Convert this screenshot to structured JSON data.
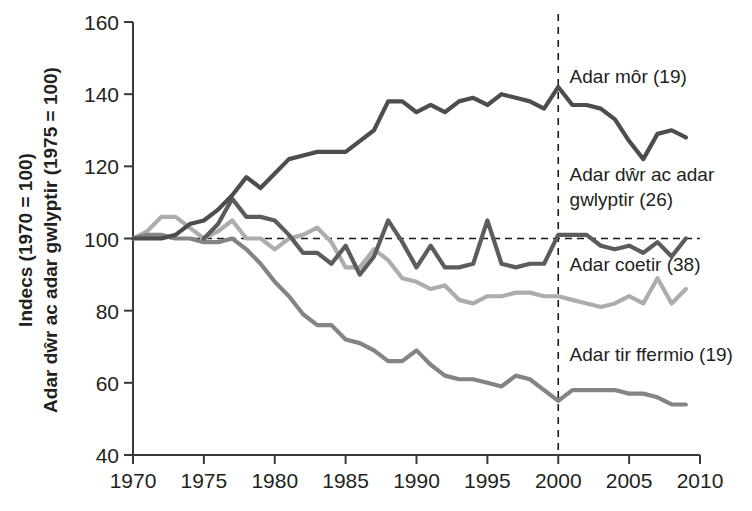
{
  "chart_data": {
    "type": "line",
    "title": "",
    "subtitle": "",
    "xlabel": "",
    "ylabel": "Indecs (1970 = 100)\nAdar dŵr ac adar gwlyptir (1975 = 100)",
    "ylabel_line1": "Indecs (1970 = 100)",
    "ylabel_line2": "Adar dŵr ac adar gwlyptir (1975 = 100)",
    "xlim": [
      1970,
      2010
    ],
    "ylim": [
      40,
      160
    ],
    "xticks": [
      1970,
      1975,
      1980,
      1985,
      1990,
      1995,
      2000,
      2005,
      2010
    ],
    "yticks": [
      40,
      60,
      80,
      100,
      120,
      140,
      160
    ],
    "grid": false,
    "legend_position": "inline-right",
    "annotations": [
      {
        "name": "reference-line-100",
        "type": "horizontal-dashed",
        "value": 100
      },
      {
        "name": "reference-line-2000",
        "type": "vertical-dashed",
        "value": 2000
      }
    ],
    "series": [
      {
        "name": "Adar môr (19)",
        "label": "Adar môr (19)",
        "color": "#4d4d4d",
        "label_x": 2000.8,
        "label_y": 143,
        "x": [
          1970,
          1971,
          1972,
          1973,
          1974,
          1975,
          1976,
          1977,
          1978,
          1979,
          1980,
          1981,
          1982,
          1983,
          1984,
          1985,
          1986,
          1987,
          1988,
          1989,
          1990,
          1991,
          1992,
          1993,
          1994,
          1995,
          1996,
          1997,
          1998,
          1999,
          2000,
          2001,
          2002,
          2003,
          2004,
          2005,
          2006,
          2007,
          2008,
          2009
        ],
        "y": [
          100,
          100,
          100,
          101,
          104,
          105,
          108,
          112,
          117,
          114,
          118,
          122,
          123,
          124,
          124,
          124,
          127,
          130,
          138,
          138,
          135,
          137,
          135,
          138,
          139,
          137,
          140,
          139,
          138,
          136,
          142,
          137,
          137,
          136,
          133,
          127,
          122,
          129,
          130,
          128
        ]
      },
      {
        "name": "Adar dŵr ac adar gwlyptir (26)",
        "label_line1": "Adar dŵr ac adar",
        "label_line2": "gwlyptir (26)",
        "color": "#5c5c5c",
        "label_x": 2000.8,
        "label_y": 116,
        "x": [
          1975,
          1976,
          1977,
          1978,
          1979,
          1980,
          1981,
          1982,
          1983,
          1984,
          1985,
          1986,
          1987,
          1988,
          1989,
          1990,
          1991,
          1992,
          1993,
          1994,
          1995,
          1996,
          1997,
          1998,
          1999,
          2000,
          2001,
          2002,
          2003,
          2004,
          2005,
          2006,
          2007,
          2008,
          2009
        ],
        "y": [
          100,
          104,
          111,
          106,
          106,
          105,
          101,
          96,
          96,
          93,
          98,
          90,
          95,
          105,
          99,
          92,
          98,
          92,
          92,
          93,
          105,
          93,
          92,
          93,
          93,
          101,
          101,
          101,
          98,
          97,
          98,
          96,
          99,
          95,
          100
        ]
      },
      {
        "name": "Adar coetir (38)",
        "label": "Adar coetir (38)",
        "color": "#adadad",
        "label_x": 2000.8,
        "label_y": 91,
        "x": [
          1970,
          1971,
          1972,
          1973,
          1974,
          1975,
          1976,
          1977,
          1978,
          1979,
          1980,
          1981,
          1982,
          1983,
          1984,
          1985,
          1986,
          1987,
          1988,
          1989,
          1990,
          1991,
          1992,
          1993,
          1994,
          1995,
          1996,
          1997,
          1998,
          1999,
          2000,
          2001,
          2002,
          2003,
          2004,
          2005,
          2006,
          2007,
          2008,
          2009
        ],
        "y": [
          100,
          102,
          106,
          106,
          103,
          100,
          102,
          105,
          100,
          100,
          97,
          100,
          101,
          103,
          99,
          92,
          92,
          97,
          94,
          89,
          88,
          86,
          87,
          83,
          82,
          84,
          84,
          85,
          85,
          84,
          84,
          83,
          82,
          81,
          82,
          84,
          82,
          89,
          82,
          86
        ]
      },
      {
        "name": "Adar tir ffermio (19)",
        "label": "Adar tir ffermio (19)",
        "color": "#848484",
        "label_x": 2000.8,
        "label_y": 66,
        "x": [
          1970,
          1971,
          1972,
          1973,
          1974,
          1975,
          1976,
          1977,
          1978,
          1979,
          1980,
          1981,
          1982,
          1983,
          1984,
          1985,
          1986,
          1987,
          1988,
          1989,
          1990,
          1991,
          1992,
          1993,
          1994,
          1995,
          1996,
          1997,
          1998,
          1999,
          2000,
          2001,
          2002,
          2003,
          2004,
          2005,
          2006,
          2007,
          2008,
          2009
        ],
        "y": [
          100,
          101,
          101,
          100,
          100,
          99,
          99,
          100,
          97,
          93,
          88,
          84,
          79,
          76,
          76,
          72,
          71,
          69,
          66,
          66,
          69,
          65,
          62,
          61,
          61,
          60,
          59,
          62,
          61,
          58,
          55,
          58,
          58,
          58,
          58,
          57,
          57,
          56,
          54,
          54
        ]
      }
    ]
  }
}
